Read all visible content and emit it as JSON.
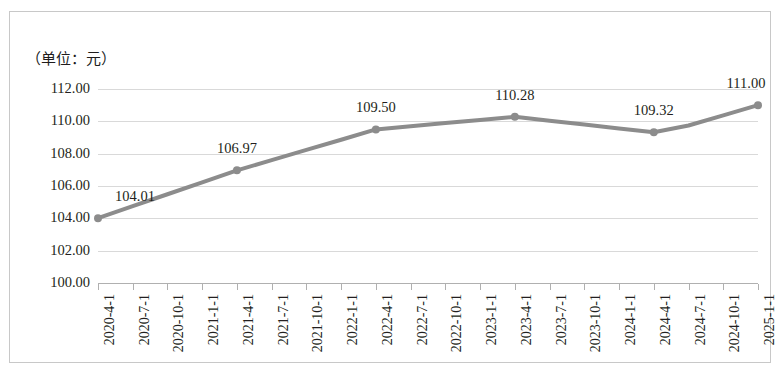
{
  "chart_data": {
    "type": "line",
    "title": "",
    "subtitle": "",
    "unit_note": "（单位：元）",
    "xlabel": "",
    "ylabel": "",
    "ylim": [
      100.0,
      112.0
    ],
    "ytick_step": 2.0,
    "grid": true,
    "legend": false,
    "series_color": "#8c8c8c",
    "categories": [
      "2020-4-1",
      "2020-7-1",
      "2020-10-1",
      "2021-1-1",
      "2021-4-1",
      "2021-7-1",
      "2021-10-1",
      "2022-1-1",
      "2022-4-1",
      "2022-7-1",
      "2022-10-1",
      "2023-1-1",
      "2023-4-1",
      "2023-7-1",
      "2023-10-1",
      "2024-1-1",
      "2024-4-1",
      "2024-7-1",
      "2024-10-1",
      "2025-1-1"
    ],
    "ytick_labels": [
      "112.00",
      "110.00",
      "108.00",
      "106.00",
      "104.00",
      "102.00",
      "100.00"
    ],
    "ytick_values": [
      112.0,
      110.0,
      108.0,
      106.0,
      104.0,
      102.0,
      100.0
    ],
    "series": [
      {
        "name": "价格",
        "values": [
          104.01,
          104.75,
          105.49,
          106.23,
          106.97,
          107.6,
          108.23,
          108.86,
          109.5,
          109.69,
          109.89,
          110.08,
          110.28,
          110.04,
          109.8,
          109.56,
          109.32,
          109.74,
          110.37,
          111.0
        ],
        "labeled_points": [
          {
            "category": "2020-4-1",
            "index": 0,
            "value": 104.01,
            "label": "104.01"
          },
          {
            "category": "2021-4-1",
            "index": 4,
            "value": 106.97,
            "label": "106.97"
          },
          {
            "category": "2022-4-1",
            "index": 8,
            "value": 109.5,
            "label": "109.50"
          },
          {
            "category": "2023-4-1",
            "index": 12,
            "value": 110.28,
            "label": "110.28"
          },
          {
            "category": "2024-4-1",
            "index": 16,
            "value": 109.32,
            "label": "109.32"
          },
          {
            "category": "2025-1-1",
            "index": 19,
            "value": 111.0,
            "label": "111.00"
          }
        ],
        "marker_indices": [
          0,
          4,
          8,
          12,
          16,
          19
        ]
      }
    ]
  }
}
